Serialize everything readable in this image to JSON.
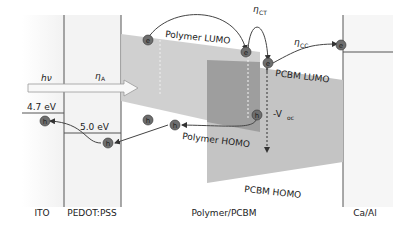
{
  "diagram": {
    "layers": [
      {
        "id": "ito",
        "label": "ITO"
      },
      {
        "id": "pedot",
        "label": "PEDOT:PSS"
      },
      {
        "id": "active",
        "label": "Polymer/PCBM"
      },
      {
        "id": "cathode",
        "label": "Ca/Al"
      }
    ],
    "levels": {
      "polymer_lumo": "Polymer LUMO",
      "polymer_homo": "Polymer HOMO",
      "pcbm_lumo": "PCBM LUMO",
      "pcbm_homo": "PCBM HOMO"
    },
    "work_functions": {
      "ito": "4.7 eV",
      "pedot": "5.0 eV"
    },
    "efficiencies": {
      "absorption": "η",
      "absorption_sub": "A",
      "charge_transfer": "η",
      "charge_transfer_sub": "CT",
      "charge_collection": "η",
      "charge_collection_sub": "CC"
    },
    "photon": "hν",
    "voc": {
      "prefix": "-V",
      "sub": "oc"
    },
    "carriers": {
      "electron": "e",
      "hole": "h"
    },
    "colors": {
      "polymer_region": "#c8c8c8",
      "overlap_region": "#9a9a9a",
      "pcbm_region": "#bdbdbd",
      "carrier_fill": "#6e6e6e",
      "line": "#555555"
    }
  }
}
